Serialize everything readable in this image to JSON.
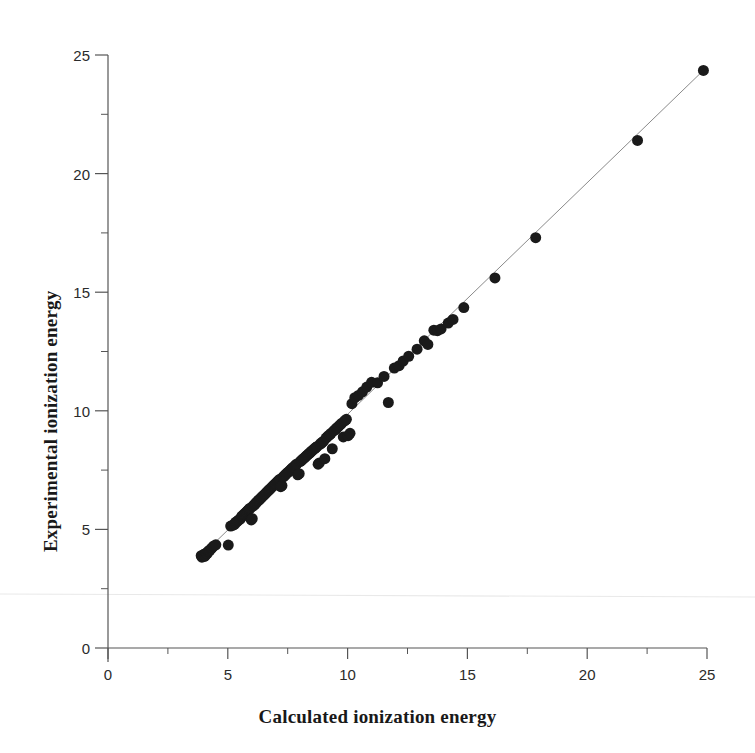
{
  "figure": {
    "background": "#ffffff",
    "ink_color": "#1a1a1a",
    "axis_color": "#555555",
    "trendline_color": "#8a8a8a",
    "artifact_color": "#e8e8e8"
  },
  "chart_data": {
    "type": "scatter",
    "title": "",
    "xlabel": "Calculated ionization energy",
    "ylabel": "Experimental ionization energy",
    "xlim": [
      0,
      25
    ],
    "ylim": [
      0,
      25
    ],
    "xticks": [
      0,
      5,
      10,
      15,
      20,
      25
    ],
    "yticks": [
      0,
      5,
      10,
      15,
      20,
      25
    ],
    "xtick_labels": [
      "0",
      "5",
      "10",
      "15",
      "20",
      "25"
    ],
    "ytick_labels": [
      "0",
      "5",
      "10",
      "15",
      "20",
      "25"
    ],
    "xminor_ticks": [
      2.5,
      7.5,
      12.5,
      17.5,
      22.5
    ],
    "yminor_ticks": [
      2.5,
      7.5,
      12.5,
      17.5,
      22.5
    ],
    "grid": false,
    "legend": null,
    "marker": {
      "shape": "circle",
      "size": 11,
      "color": "#1a1a1a"
    },
    "trendline": {
      "type": "identity",
      "x": [
        3.8,
        24.9
      ],
      "y": [
        3.8,
        24.4
      ],
      "color": "#8a8a8a",
      "width": 1
    },
    "annotations": [],
    "points": [
      [
        3.89,
        3.89
      ],
      [
        3.92,
        3.83
      ],
      [
        3.95,
        3.9
      ],
      [
        4.0,
        3.95
      ],
      [
        4.03,
        3.86
      ],
      [
        4.07,
        3.92
      ],
      [
        4.1,
        4.0
      ],
      [
        4.14,
        3.98
      ],
      [
        4.18,
        4.06
      ],
      [
        4.21,
        4.1
      ],
      [
        4.25,
        4.12
      ],
      [
        4.3,
        4.18
      ],
      [
        4.34,
        4.22
      ],
      [
        4.41,
        4.3
      ],
      [
        4.5,
        4.35
      ],
      [
        5.02,
        4.34
      ],
      [
        5.12,
        5.14
      ],
      [
        5.2,
        5.17
      ],
      [
        5.28,
        5.21
      ],
      [
        5.32,
        5.3
      ],
      [
        5.39,
        5.33
      ],
      [
        5.44,
        5.39
      ],
      [
        5.5,
        5.42
      ],
      [
        5.55,
        5.48
      ],
      [
        5.58,
        5.55
      ],
      [
        5.62,
        5.58
      ],
      [
        5.66,
        5.62
      ],
      [
        5.7,
        5.66
      ],
      [
        5.74,
        5.7
      ],
      [
        5.78,
        5.74
      ],
      [
        5.82,
        5.78
      ],
      [
        5.86,
        5.82
      ],
      [
        5.9,
        5.86
      ],
      [
        5.94,
        5.9
      ],
      [
        5.98,
        5.4
      ],
      [
        6.02,
        5.45
      ],
      [
        6.05,
        5.98
      ],
      [
        6.09,
        6.02
      ],
      [
        6.13,
        6.06
      ],
      [
        6.16,
        6.1
      ],
      [
        6.2,
        6.14
      ],
      [
        6.24,
        6.18
      ],
      [
        6.28,
        6.22
      ],
      [
        6.32,
        6.26
      ],
      [
        6.36,
        6.3
      ],
      [
        6.4,
        6.34
      ],
      [
        6.44,
        6.38
      ],
      [
        6.48,
        6.42
      ],
      [
        6.52,
        6.46
      ],
      [
        6.56,
        6.5
      ],
      [
        6.6,
        6.54
      ],
      [
        6.64,
        6.58
      ],
      [
        6.68,
        6.62
      ],
      [
        6.72,
        6.66
      ],
      [
        6.76,
        6.7
      ],
      [
        6.8,
        6.74
      ],
      [
        6.84,
        6.78
      ],
      [
        6.88,
        6.82
      ],
      [
        6.92,
        6.86
      ],
      [
        6.96,
        6.9
      ],
      [
        7.0,
        6.94
      ],
      [
        7.05,
        6.99
      ],
      [
        7.09,
        7.03
      ],
      [
        7.13,
        7.07
      ],
      [
        7.17,
        7.11
      ],
      [
        7.21,
        6.8
      ],
      [
        7.26,
        6.85
      ],
      [
        7.3,
        7.2
      ],
      [
        7.34,
        7.24
      ],
      [
        7.38,
        7.28
      ],
      [
        7.42,
        7.32
      ],
      [
        7.46,
        7.36
      ],
      [
        7.5,
        7.4
      ],
      [
        7.55,
        7.44
      ],
      [
        7.59,
        7.48
      ],
      [
        7.63,
        7.52
      ],
      [
        7.67,
        7.56
      ],
      [
        7.71,
        7.6
      ],
      [
        7.76,
        7.64
      ],
      [
        7.8,
        7.68
      ],
      [
        7.84,
        7.72
      ],
      [
        7.88,
        7.76
      ],
      [
        7.92,
        7.3
      ],
      [
        7.98,
        7.35
      ],
      [
        8.02,
        7.86
      ],
      [
        8.07,
        7.9
      ],
      [
        8.11,
        7.94
      ],
      [
        8.15,
        7.98
      ],
      [
        8.2,
        8.02
      ],
      [
        8.24,
        8.06
      ],
      [
        8.28,
        8.1
      ],
      [
        8.33,
        8.14
      ],
      [
        8.37,
        8.18
      ],
      [
        8.42,
        8.22
      ],
      [
        8.46,
        8.26
      ],
      [
        8.5,
        8.3
      ],
      [
        8.55,
        8.34
      ],
      [
        8.59,
        8.38
      ],
      [
        8.64,
        8.42
      ],
      [
        8.68,
        8.46
      ],
      [
        8.73,
        8.5
      ],
      [
        8.77,
        7.75
      ],
      [
        8.82,
        7.8
      ],
      [
        8.86,
        8.6
      ],
      [
        8.91,
        8.64
      ],
      [
        8.95,
        8.68
      ],
      [
        9.0,
        8.72
      ],
      [
        9.05,
        7.98
      ],
      [
        9.1,
        8.85
      ],
      [
        9.15,
        8.9
      ],
      [
        9.2,
        8.95
      ],
      [
        9.26,
        9.0
      ],
      [
        9.31,
        9.05
      ],
      [
        9.36,
        8.4
      ],
      [
        9.42,
        9.15
      ],
      [
        9.47,
        9.2
      ],
      [
        9.53,
        9.26
      ],
      [
        9.58,
        9.3
      ],
      [
        9.64,
        9.36
      ],
      [
        9.7,
        9.42
      ],
      [
        9.76,
        9.48
      ],
      [
        9.82,
        8.9
      ],
      [
        9.88,
        9.58
      ],
      [
        9.95,
        9.64
      ],
      [
        10.02,
        8.95
      ],
      [
        10.1,
        9.05
      ],
      [
        10.18,
        10.3
      ],
      [
        10.3,
        10.55
      ],
      [
        10.45,
        10.65
      ],
      [
        10.62,
        10.8
      ],
      [
        10.8,
        11.0
      ],
      [
        11.0,
        11.2
      ],
      [
        11.25,
        11.18
      ],
      [
        11.52,
        11.45
      ],
      [
        11.7,
        10.35
      ],
      [
        11.95,
        11.8
      ],
      [
        12.15,
        11.9
      ],
      [
        12.32,
        12.1
      ],
      [
        12.55,
        12.3
      ],
      [
        12.9,
        12.6
      ],
      [
        13.2,
        12.95
      ],
      [
        13.35,
        12.8
      ],
      [
        13.6,
        13.4
      ],
      [
        13.75,
        13.38
      ],
      [
        13.9,
        13.45
      ],
      [
        14.2,
        13.7
      ],
      [
        14.4,
        13.85
      ],
      [
        14.85,
        14.35
      ],
      [
        16.15,
        15.6
      ],
      [
        17.85,
        17.3
      ],
      [
        22.1,
        21.4
      ],
      [
        24.85,
        24.35
      ]
    ]
  }
}
